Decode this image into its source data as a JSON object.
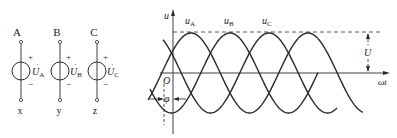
{
  "sources": [
    {
      "top_label": "A",
      "voltage_label": "U",
      "subscript": "A",
      "bottom_label": "x",
      "plus": "+",
      "minus": "−"
    },
    {
      "top_label": "B",
      "voltage_label": "U",
      "subscript": "B",
      "bottom_label": "y",
      "plus": "+",
      "minus": "−"
    },
    {
      "top_label": "C",
      "voltage_label": "U",
      "subscript": "C",
      "bottom_label": "z",
      "plus": "+",
      "minus": "−"
    }
  ],
  "waveform": {
    "y_axis_label": "u",
    "x_axis_label": "ωt",
    "origin_label": "O",
    "phase_label": "φ",
    "amplitude_label": "U",
    "curves": [
      {
        "name": "u",
        "subscript": "A"
      },
      {
        "name": "u",
        "subscript": "B"
      },
      {
        "name": "u",
        "subscript": "C"
      }
    ]
  },
  "colors": {
    "line": "#2a2a2a",
    "background": "#ffffff"
  }
}
